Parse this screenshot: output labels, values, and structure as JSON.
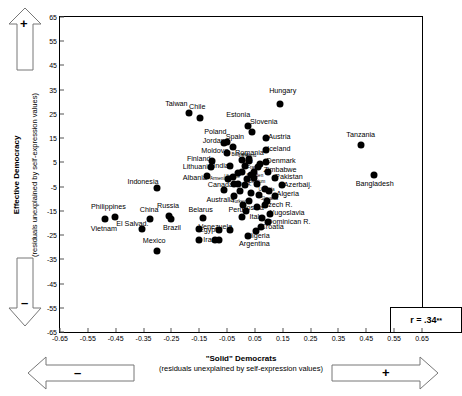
{
  "chart_data": {
    "type": "scatter",
    "title": "",
    "xlabel": "\"Solid\" Democrats",
    "xlabel_sub": "(residuals unexplained by self-expression values)",
    "ylabel": "Effective Democracy",
    "ylabel_sub": "(residuals unexplained by self-expression values)",
    "xlim": [
      -0.65,
      0.65
    ],
    "ylim": [
      -65,
      65
    ],
    "xticks": [
      "-0.65",
      "-0.55",
      "-0.45",
      "-0.35",
      "-0.25",
      "-0.15",
      "-0.05",
      "0.05",
      "0.15",
      "0.25",
      "0.35",
      "0.45",
      "0.55",
      "0.65"
    ],
    "xtick_values": [
      -0.65,
      -0.55,
      -0.45,
      -0.35,
      -0.25,
      -0.15,
      -0.05,
      0.05,
      0.15,
      0.25,
      0.35,
      0.45,
      0.55,
      0.65
    ],
    "yticks": [
      "65",
      "55",
      "45",
      "35",
      "25",
      "15",
      "5",
      "-5",
      "-15",
      "-25",
      "-35",
      "-45",
      "-55",
      "-65"
    ],
    "ytick_values": [
      65,
      55,
      45,
      35,
      25,
      15,
      5,
      -5,
      -15,
      -25,
      -35,
      -45,
      -55,
      -65
    ],
    "grid": false,
    "legend": "none",
    "annotation": "r = .34**",
    "annotation_r": "r = .34",
    "annotation_stars": "**",
    "points": [
      {
        "label": "Taiwan",
        "x": -0.188,
        "y": 25.5,
        "lx": -0.232,
        "ly": 29.0,
        "size": "n"
      },
      {
        "label": "Chile",
        "x": -0.148,
        "y": 23.5,
        "lx": -0.157,
        "ly": 28.0,
        "size": "n"
      },
      {
        "label": "Hungary",
        "x": 0.14,
        "y": 29.0,
        "lx": 0.15,
        "ly": 34.5,
        "size": "n"
      },
      {
        "label": "Estonia",
        "x": 0.024,
        "y": 20.0,
        "lx": -0.01,
        "ly": 24.5,
        "size": "n"
      },
      {
        "label": "Slovenia",
        "x": 0.04,
        "y": 17.5,
        "lx": 0.082,
        "ly": 21.5,
        "size": "n"
      },
      {
        "label": "Poland",
        "x": -0.06,
        "y": 13.0,
        "lx": -0.092,
        "ly": 17.5,
        "size": "n"
      },
      {
        "label": "Spain",
        "x": -0.028,
        "y": 11.5,
        "lx": -0.022,
        "ly": 15.5,
        "size": "n"
      },
      {
        "label": "Austria",
        "x": 0.088,
        "y": 15.0,
        "lx": 0.138,
        "ly": 15.5,
        "size": "n"
      },
      {
        "label": "Tanzania",
        "x": 0.43,
        "y": 12.0,
        "lx": 0.43,
        "ly": 16.5,
        "size": "n"
      },
      {
        "label": "Iceland",
        "x": 0.088,
        "y": 10.0,
        "lx": 0.136,
        "ly": 10.5,
        "size": "n"
      },
      {
        "label": "Jordan",
        "x": -0.052,
        "y": 13.5,
        "lx": -0.098,
        "ly": 14.0,
        "size": "n"
      },
      {
        "label": "Moldova",
        "x": -0.052,
        "y": 9.0,
        "lx": -0.094,
        "ly": 9.5,
        "size": "n"
      },
      {
        "label": "Romania",
        "x": 0.028,
        "y": 6.5,
        "lx": 0.03,
        "ly": 9.0,
        "size": "n"
      },
      {
        "label": "Denmark",
        "x": 0.09,
        "y": 5.0,
        "lx": 0.144,
        "ly": 5.5,
        "size": "n"
      },
      {
        "label": "Zimbabwe",
        "x": 0.096,
        "y": 1.0,
        "lx": 0.14,
        "ly": 2.0,
        "size": "n"
      },
      {
        "label": "Pakistan",
        "x": 0.122,
        "y": -1.5,
        "lx": 0.172,
        "ly": -1.0,
        "size": "n"
      },
      {
        "label": "Bangladesh",
        "x": 0.478,
        "y": 0.0,
        "lx": 0.48,
        "ly": -4.0,
        "size": "n"
      },
      {
        "label": "Azerbaij.",
        "x": 0.148,
        "y": -4.5,
        "lx": 0.204,
        "ly": -4.5,
        "size": "n"
      },
      {
        "label": "Finland",
        "x": -0.104,
        "y": 5.5,
        "lx": -0.152,
        "ly": 6.5,
        "size": "n"
      },
      {
        "label": "Lithuania",
        "x": -0.106,
        "y": 3.0,
        "lx": -0.157,
        "ly": 3.0,
        "size": "n"
      },
      {
        "label": "India",
        "x": -0.04,
        "y": 3.5,
        "lx": -0.072,
        "ly": 3.5,
        "size": "n"
      },
      {
        "label": "Albania",
        "x": -0.122,
        "y": -0.5,
        "lx": -0.166,
        "ly": -1.5,
        "size": "n"
      },
      {
        "label": "Indonesia",
        "x": -0.3,
        "y": -5.5,
        "lx": -0.352,
        "ly": -3.0,
        "size": "n"
      },
      {
        "label": "Canada",
        "x": -0.026,
        "y": -4.0,
        "lx": -0.074,
        "ly": -4.5,
        "size": "n"
      },
      {
        "label": "Australia",
        "x": -0.024,
        "y": -9.0,
        "lx": -0.074,
        "ly": -10.5,
        "size": "n"
      },
      {
        "label": "Algeria",
        "x": 0.122,
        "y": -9.0,
        "lx": 0.168,
        "ly": -8.0,
        "size": "n"
      },
      {
        "label": "Armenia",
        "x": -0.048,
        "y": -2.0,
        "lx": -0.081,
        "ly": -2.0,
        "size": "t"
      },
      {
        "label": "Ukraine",
        "x": -0.03,
        "y": -1.0,
        "lx": -0.032,
        "ly": -1.0,
        "size": "t"
      },
      {
        "label": "Bulgaria",
        "x": 0.004,
        "y": 6.0,
        "lx": -0.004,
        "ly": 8.0,
        "size": "t"
      },
      {
        "label": "Ireland",
        "x": 0.03,
        "y": 5.5,
        "lx": 0.03,
        "ly": 7.5,
        "size": "t"
      },
      {
        "label": "Japan",
        "x": 0.014,
        "y": 3.5,
        "lx": 0.02,
        "ly": 5.0,
        "size": "t"
      },
      {
        "label": "France",
        "x": 0.046,
        "y": 1.0,
        "lx": 0.048,
        "ly": 2.5,
        "size": "t"
      },
      {
        "label": "Sweden",
        "x": 0.048,
        "y": -1.5,
        "lx": 0.05,
        "ly": -0.5,
        "size": "t"
      },
      {
        "label": "Belgium",
        "x": 0.056,
        "y": -4.0,
        "lx": 0.058,
        "ly": -3.0,
        "size": "t"
      },
      {
        "label": "U.S.A.",
        "x": 0.016,
        "y": -4.5,
        "lx": 0.014,
        "ly": -4.5,
        "size": "t"
      },
      {
        "label": "Uganda",
        "x": 0.086,
        "y": -6.0,
        "lx": 0.092,
        "ly": -6.5,
        "size": "t"
      },
      {
        "label": "Slovakia",
        "x": 0.094,
        "y": -11.0,
        "lx": 0.102,
        "ly": -10.0,
        "size": "t"
      },
      {
        "label": "Turkey",
        "x": 0.006,
        "y": -12.5,
        "lx": -0.008,
        "ly": -11.5,
        "size": "t"
      },
      {
        "label": "Peru",
        "x": 0.018,
        "y": -15.0,
        "lx": -0.018,
        "ly": -14.5,
        "size": "n"
      },
      {
        "label": "Bosnia",
        "x": 0.058,
        "y": -13.5,
        "lx": 0.042,
        "ly": -14.0,
        "size": "n"
      },
      {
        "label": "Czech R.",
        "x": 0.086,
        "y": -12.5,
        "lx": 0.132,
        "ly": -12.5,
        "size": "n"
      },
      {
        "label": "Yugoslavia",
        "x": 0.104,
        "y": -16.5,
        "lx": 0.166,
        "ly": -16.0,
        "size": "n"
      },
      {
        "label": "Italy",
        "x": 0.074,
        "y": -18.0,
        "lx": 0.054,
        "ly": -17.5,
        "size": "n"
      },
      {
        "label": "Dominican R.",
        "x": 0.098,
        "y": -19.5,
        "lx": 0.172,
        "ly": -19.5,
        "size": "n"
      },
      {
        "label": "Croatia",
        "x": 0.072,
        "y": -21.5,
        "lx": 0.112,
        "ly": -21.5,
        "size": "n"
      },
      {
        "label": "Nigeria",
        "x": 0.054,
        "y": -23.5,
        "lx": 0.062,
        "ly": -25.5,
        "size": "n"
      },
      {
        "label": "Argentina",
        "x": 0.024,
        "y": -25.5,
        "lx": 0.048,
        "ly": -28.5,
        "size": "n"
      },
      {
        "label": "Venezuela",
        "x": -0.04,
        "y": -23.0,
        "lx": -0.092,
        "ly": -21.5,
        "size": "n"
      },
      {
        "label": "Belarus",
        "x": -0.136,
        "y": -18.0,
        "lx": -0.145,
        "ly": -14.5,
        "size": "n"
      },
      {
        "label": "Egypt",
        "x": -0.08,
        "y": -23.0,
        "lx": -0.118,
        "ly": -23.0,
        "size": "n"
      },
      {
        "label": "Iran",
        "x": -0.08,
        "y": -27.0,
        "lx": -0.113,
        "ly": -27.0,
        "size": "n"
      },
      {
        "label": "Russia",
        "x": -0.26,
        "y": -17.0,
        "lx": -0.262,
        "ly": -13.0,
        "size": "n"
      },
      {
        "label": "Brazil",
        "x": -0.252,
        "y": -18.5,
        "lx": -0.248,
        "ly": -22.0,
        "size": "n"
      },
      {
        "label": "China",
        "x": -0.328,
        "y": -18.5,
        "lx": -0.33,
        "ly": -14.5,
        "size": "n"
      },
      {
        "label": "El Salvad.",
        "x": -0.356,
        "y": -22.5,
        "lx": -0.39,
        "ly": -20.5,
        "size": "n"
      },
      {
        "label": "Philippines",
        "x": -0.452,
        "y": -17.5,
        "lx": -0.476,
        "ly": -13.5,
        "size": "n"
      },
      {
        "label": "Vietnam",
        "x": -0.49,
        "y": -18.5,
        "lx": -0.492,
        "ly": -22.5,
        "size": "n"
      },
      {
        "label": "Mexico",
        "x": -0.3,
        "y": -31.5,
        "lx": -0.312,
        "ly": -27.5,
        "size": "n"
      },
      {
        "label": "",
        "x": -0.152,
        "y": -22.5,
        "lx": 0,
        "ly": 0,
        "size": "n"
      },
      {
        "label": "",
        "x": -0.092,
        "y": -27.0,
        "lx": 0,
        "ly": 0,
        "size": "n"
      },
      {
        "label": "",
        "x": 0.002,
        "y": 1.0,
        "lx": 0,
        "ly": 0,
        "size": "n"
      },
      {
        "label": "",
        "x": 0.036,
        "y": 0.0,
        "lx": 0,
        "ly": 0,
        "size": "n"
      },
      {
        "label": "",
        "x": 0.02,
        "y": -2.0,
        "lx": 0,
        "ly": 0,
        "size": "n"
      },
      {
        "label": "",
        "x": 0.062,
        "y": 3.0,
        "lx": 0,
        "ly": 0,
        "size": "n"
      },
      {
        "label": "",
        "x": 0.07,
        "y": 4.5,
        "lx": 0,
        "ly": 0,
        "size": "n"
      },
      {
        "label": "",
        "x": -0.012,
        "y": 0.5,
        "lx": 0,
        "ly": 0,
        "size": "n"
      },
      {
        "label": "",
        "x": -0.004,
        "y": -7.0,
        "lx": 0,
        "ly": 0,
        "size": "n"
      },
      {
        "label": "",
        "x": 0.036,
        "y": -7.5,
        "lx": 0,
        "ly": 0,
        "size": "n"
      },
      {
        "label": "",
        "x": 0.064,
        "y": -8.5,
        "lx": 0,
        "ly": 0,
        "size": "n"
      },
      {
        "label": "",
        "x": 0.03,
        "y": -11.0,
        "lx": 0,
        "ly": 0,
        "size": "n"
      },
      {
        "label": "",
        "x": -0.01,
        "y": -4.0,
        "lx": 0,
        "ly": 0,
        "size": "n"
      },
      {
        "label": "",
        "x": -0.06,
        "y": -6.5,
        "lx": 0,
        "ly": 0,
        "size": "n"
      },
      {
        "label": "",
        "x": 0.004,
        "y": -17.5,
        "lx": 0,
        "ly": 0,
        "size": "n"
      },
      {
        "label": "",
        "x": -0.15,
        "y": -27.0,
        "lx": 0,
        "ly": 0,
        "size": "n"
      },
      {
        "label": "",
        "x": 0.1,
        "y": -7.0,
        "lx": 0,
        "ly": 0,
        "size": "n"
      }
    ]
  },
  "arrows": {
    "top_left_sign": "+",
    "bottom_left_sign": "–",
    "bottom_right_sign": "+",
    "bottom_arrow_sign": "–"
  }
}
